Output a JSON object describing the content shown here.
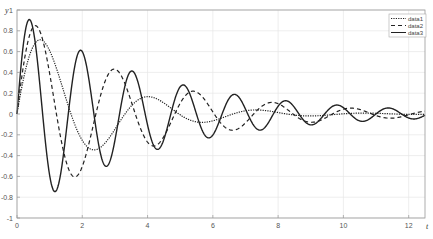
{
  "chart_data": {
    "type": "line",
    "title": "",
    "xlabel": "t",
    "ylabel": "y",
    "xlim": [
      0,
      12.5
    ],
    "ylim": [
      -1,
      1
    ],
    "grid": true,
    "legend_position": "upper right",
    "x_ticks": [
      0,
      2,
      4,
      6,
      8,
      10,
      12
    ],
    "x_tick_labels": [
      "0",
      "2",
      "4",
      "6",
      "8",
      "10",
      "12"
    ],
    "y_ticks": [
      -1,
      -0.8,
      -0.6,
      -0.4,
      -0.2,
      0,
      0.2,
      0.4,
      0.6,
      0.8,
      1
    ],
    "y_tick_labels": [
      "-1",
      "-0.8",
      "-0.6",
      "-0.4",
      "-0.2",
      "0",
      "0.2",
      "0.4",
      "0.6",
      "0.8",
      "1"
    ],
    "series": [
      {
        "name": "data1",
        "style": "dotted",
        "color": "#222222",
        "model": "exp(-0.44 t) * sin(1.9 t)",
        "decay": 0.44,
        "omega": 1.9,
        "key_points": [
          [
            0,
            0
          ],
          [
            0.71,
            0.69
          ],
          [
            2.36,
            -0.32
          ],
          [
            4.02,
            0.15
          ],
          [
            5.67,
            -0.07
          ],
          [
            7.33,
            0.03
          ]
        ]
      },
      {
        "name": "data2",
        "style": "dashed",
        "color": "#222222",
        "model": "exp(-0.28 t) * sin(2.6 t)",
        "decay": 0.28,
        "omega": 2.6,
        "key_points": [
          [
            0,
            0
          ],
          [
            0.56,
            0.85
          ],
          [
            1.77,
            -0.6
          ],
          [
            2.98,
            0.42
          ],
          [
            4.19,
            -0.3
          ],
          [
            5.4,
            0.21
          ],
          [
            6.6,
            -0.15
          ],
          [
            7.8,
            0.1
          ]
        ]
      },
      {
        "name": "data3",
        "style": "solid",
        "color": "#222222",
        "model": "exp(-0.25 t) * sin(4 t)",
        "decay": 0.25,
        "omega": 4.0,
        "key_points": [
          [
            0,
            0
          ],
          [
            0.38,
            0.91
          ],
          [
            1.16,
            -0.74
          ],
          [
            1.95,
            0.61
          ],
          [
            2.73,
            -0.5
          ],
          [
            3.52,
            0.41
          ],
          [
            4.3,
            -0.34
          ],
          [
            5.09,
            0.28
          ],
          [
            5.87,
            -0.23
          ],
          [
            6.66,
            0.19
          ],
          [
            7.44,
            -0.16
          ],
          [
            8.23,
            0.13
          ],
          [
            9.01,
            -0.11
          ],
          [
            9.8,
            0.09
          ],
          [
            10.58,
            -0.07
          ],
          [
            11.37,
            0.06
          ],
          [
            12.15,
            -0.05
          ]
        ]
      }
    ]
  },
  "legend": {
    "items": [
      {
        "label": "data1",
        "dash": "1.2,1.2"
      },
      {
        "label": "data2",
        "dash": "4,3"
      },
      {
        "label": "data3",
        "dash": ""
      }
    ]
  },
  "colors": {
    "axis": "#999999",
    "grid": "#e6e6e6",
    "line": "#222222"
  }
}
